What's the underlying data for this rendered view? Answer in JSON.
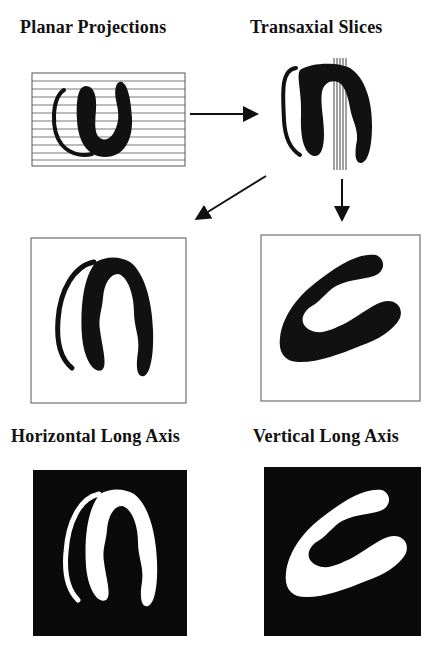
{
  "panels": {
    "planar": {
      "title": "Planar Projections"
    },
    "transaxial": {
      "title": "Transaxial Slices"
    },
    "horizontal": {
      "title": "Horizontal Long Axis"
    },
    "vertical": {
      "title": "Vertical Long Axis"
    }
  },
  "colors": {
    "ink": "#111111",
    "paper": "#ffffff",
    "frame": "#555555"
  }
}
